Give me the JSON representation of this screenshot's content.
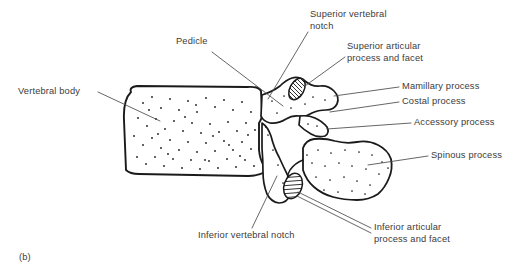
{
  "figure": {
    "caption": "(b)",
    "background_color": "#ffffff",
    "ink_color": "#1a1a1a",
    "text_color": "#3b3b3b"
  },
  "labels": {
    "vertebral_body": "Vertebral body",
    "pedicle": "Pedicle",
    "superior_vertebral_notch": "Superior vertebral\nnotch",
    "superior_articular_process": "Superior articular\nprocess and facet",
    "mamillary_process": "Mamillary process",
    "costal_process": "Costal process",
    "accessory_process": "Accessory process",
    "spinous_process": "Spinous process",
    "inferior_vertebral_notch": "Inferior vertebral notch",
    "inferior_articular_process": "Inferior articular\nprocess and facet"
  }
}
